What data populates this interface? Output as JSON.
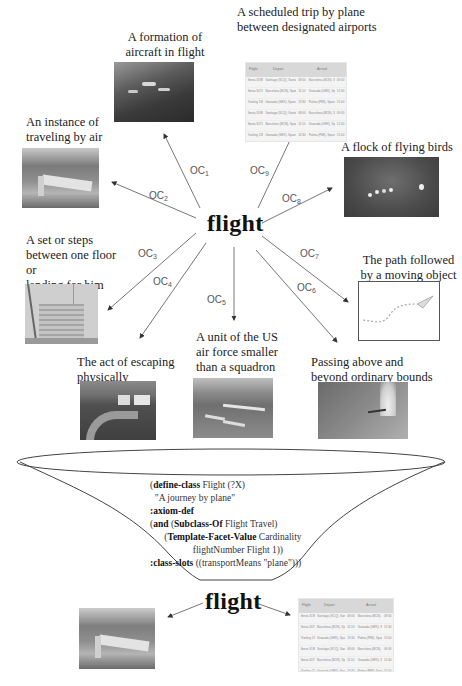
{
  "top": {
    "center_word": "flight",
    "senses": [
      {
        "id": "OC1",
        "label_main": "OC",
        "label_sub": "1",
        "caption": [
          "A formation of",
          "aircraft in flight"
        ],
        "image": "aircraft-formation-photo"
      },
      {
        "id": "OC9",
        "label_main": "OC",
        "label_sub": "9",
        "caption": [
          "A scheduled trip by plane",
          "between designated airports"
        ],
        "image": "flight-schedule-table"
      },
      {
        "id": "OC2",
        "label_main": "OC",
        "label_sub": "2",
        "caption": [
          "An instance of",
          "traveling by air"
        ],
        "image": "small-plane-landing-photo"
      },
      {
        "id": "OC8",
        "label_main": "OC",
        "label_sub": "8",
        "caption": [
          "A flock of flying birds"
        ],
        "image": "flock-of-birds-photo"
      },
      {
        "id": "OC3",
        "label_main": "OC",
        "label_sub": "3",
        "caption": [
          "A set or steps",
          "between one floor or",
          "landing for him"
        ],
        "image": "staircase-drawing"
      },
      {
        "id": "OC7",
        "label_main": "OC",
        "label_sub": "7",
        "caption": [
          "The path followed",
          "by a moving object"
        ],
        "image": "paper-plane-path-drawing"
      },
      {
        "id": "OC4",
        "label_main": "OC",
        "label_sub": "4",
        "caption": [
          "The act of escaping",
          "physically"
        ],
        "image": "escape-road-drawing"
      },
      {
        "id": "OC5",
        "label_main": "OC",
        "label_sub": "5",
        "caption": [
          "A unit of the US",
          "air force smaller",
          "than a squadron"
        ],
        "image": "planes-over-water-photo"
      },
      {
        "id": "OC6",
        "label_main": "OC",
        "label_sub": "6",
        "caption": [
          "Passing above and",
          "beyond ordinary bounds"
        ],
        "image": "supersonic-jet-photo"
      }
    ]
  },
  "schedule_table": {
    "headers": [
      "Flight",
      "Depart",
      "Arrival"
    ],
    "rows": [
      [
        "Iberia 3198",
        "Santiago (SCQ), Santiago, Spain",
        "08:00",
        "Barcelona (BCN), Spain",
        "09:30"
      ],
      [
        "Iberia 3071",
        "Barcelona (BCN), Spain",
        "11:10",
        "Granada (GRX), Spain",
        "12:40"
      ],
      [
        "Vueling 1588",
        "Granada (GRX), Spain",
        "13:30",
        "Palma (PMI), Spain",
        "15:00"
      ],
      [
        "Iberia 3198",
        "Santiago (SCQ), Santiago, Spain",
        "08:00",
        "Barcelona (BCN), Spain",
        "09:30"
      ],
      [
        "Iberia 3071",
        "Barcelona (BCN), Spain",
        "11:10",
        "Granada (GRX), Spain",
        "12:40"
      ],
      [
        "Vueling 1588",
        "Granada (GRX), Spain",
        "13:30",
        "Palma (PMI), Spain",
        "15:00"
      ]
    ]
  },
  "ontology": {
    "lines": [
      {
        "parts": [
          {
            "t": "(",
            "b": false
          },
          {
            "t": "define-class",
            "b": true
          },
          {
            "t": " Flight (?X)",
            "b": false
          }
        ]
      },
      {
        "parts": [
          {
            "t": "  \"A journey by plane\"",
            "b": false
          }
        ]
      },
      {
        "parts": [
          {
            "t": ":axiom-def",
            "b": true
          }
        ]
      },
      {
        "parts": [
          {
            "t": "(",
            "b": false
          },
          {
            "t": "and",
            "b": true
          },
          {
            "t": " (",
            "b": false
          },
          {
            "t": "Subclass-Of",
            "b": true
          },
          {
            "t": " Flight Travel)",
            "b": false
          }
        ]
      },
      {
        "parts": [
          {
            "t": "      (",
            "b": false
          },
          {
            "t": "Template-Facet-Value",
            "b": true
          },
          {
            "t": " Cardinality",
            "b": false
          }
        ]
      },
      {
        "parts": [
          {
            "t": "                  flightNumber Flight 1))",
            "b": false
          }
        ]
      },
      {
        "parts": [
          {
            "t": ":class-slots",
            "b": true
          },
          {
            "t": " ((transportMeans \"plane\")))",
            "b": false
          }
        ]
      }
    ]
  },
  "bottom": {
    "center_word": "flight",
    "left_image": "small-plane-landing-photo",
    "right_image": "flight-schedule-table"
  },
  "colors": {
    "line": "#555555",
    "text": "#222222",
    "oc_label": "#555555"
  }
}
